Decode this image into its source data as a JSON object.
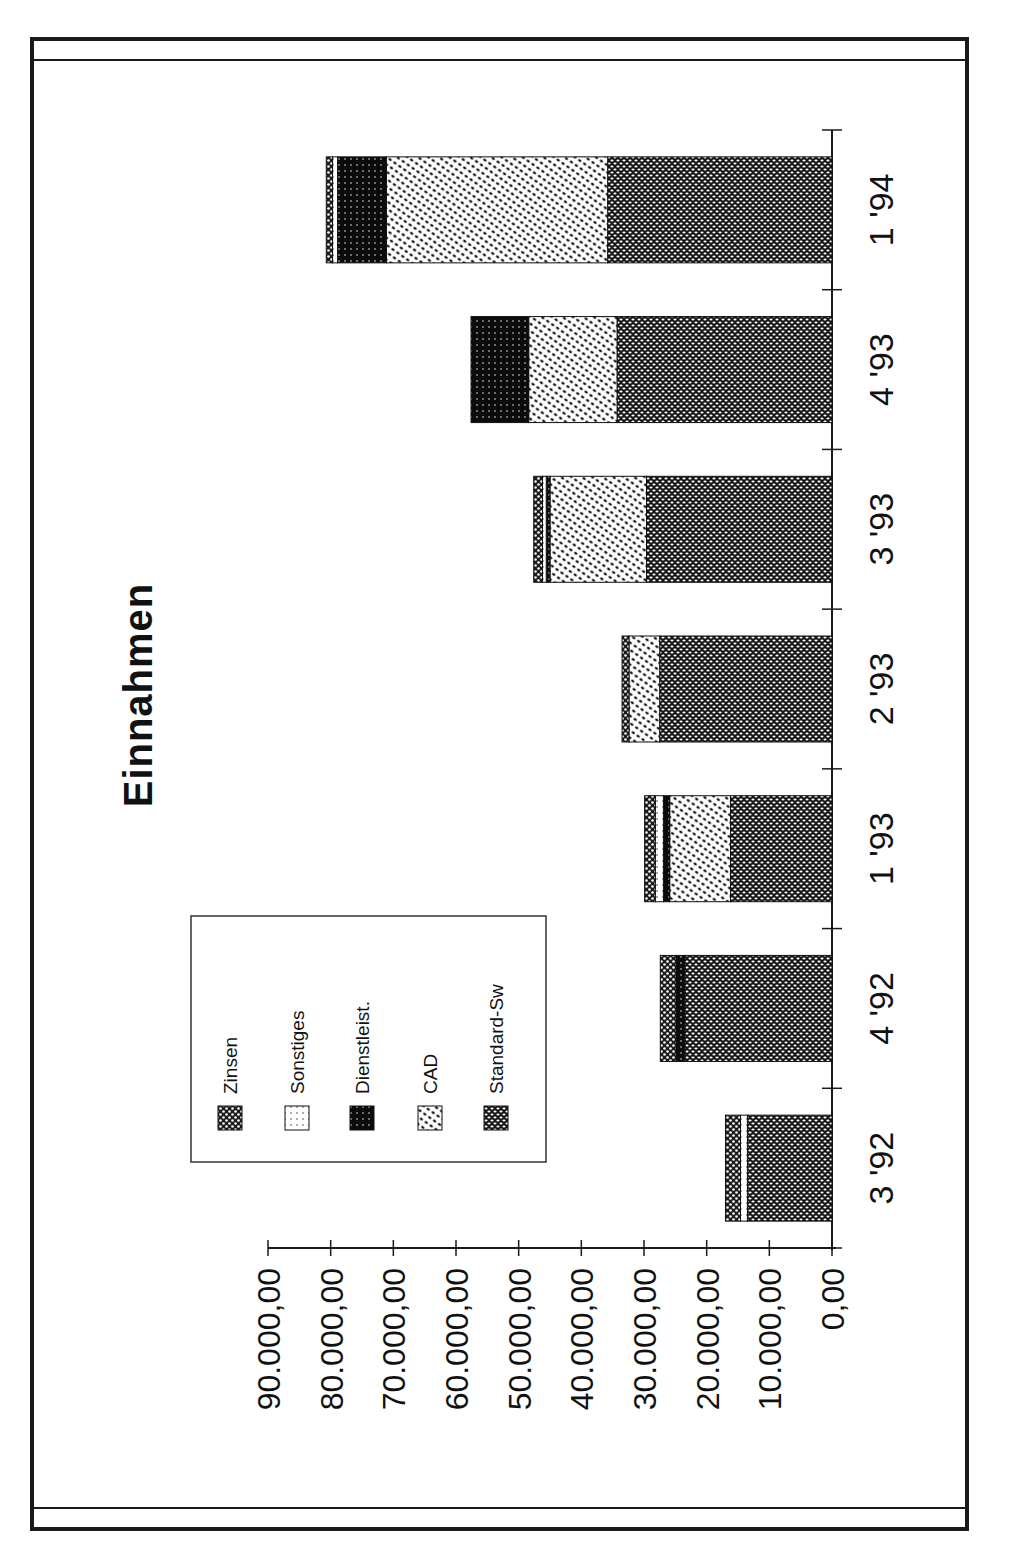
{
  "chart_data": {
    "type": "bar",
    "orientation": "stacked, rotated 90° (page printed sideways)",
    "title": "Einnahmen",
    "xlabel": "",
    "ylabel": "",
    "categories": [
      "3 '92",
      "4 '92",
      "1 '93",
      "2 '93",
      "3 '93",
      "4 '93",
      "1 '94"
    ],
    "series": [
      {
        "name": "Standard-Sw",
        "values": [
          13500,
          23500,
          16200,
          27500,
          29600,
          34300,
          35800
        ]
      },
      {
        "name": "CAD",
        "values": [
          0,
          0,
          9700,
          4900,
          15400,
          14100,
          35300
        ]
      },
      {
        "name": "Dienstleist.",
        "values": [
          0,
          1400,
          1000,
          0,
          600,
          9200,
          7800
        ]
      },
      {
        "name": "Sonstiges",
        "values": [
          1100,
          0,
          1300,
          0,
          600,
          0,
          800
        ]
      },
      {
        "name": "Zinsen",
        "values": [
          2400,
          2500,
          1700,
          1100,
          1400,
          0,
          1000
        ]
      }
    ],
    "totals": [
      17000,
      27400,
      29900,
      33500,
      47600,
      57600,
      80700
    ],
    "ylim": [
      0,
      90000
    ],
    "yticks": [
      "0,00",
      "10.000,00",
      "20.000,00",
      "30.000,00",
      "40.000,00",
      "50.000,00",
      "60.000,00",
      "70.000,00",
      "80.000,00",
      "90.000,00"
    ],
    "grid": false,
    "legend": {
      "position": "inside, upper-left of plot area (rotated)",
      "entries": [
        "Zinsen",
        "Sonstiges",
        "Dienstleist.",
        "CAD",
        "Standard-Sw"
      ]
    },
    "patterns": {
      "Standard-Sw": "dense dark dot pattern",
      "CAD": "light diagonal dot pattern",
      "Dienstleist.": "very dark dot pattern",
      "Sonstiges": "sparse light dot pattern",
      "Zinsen": "dark checker dot pattern"
    }
  }
}
